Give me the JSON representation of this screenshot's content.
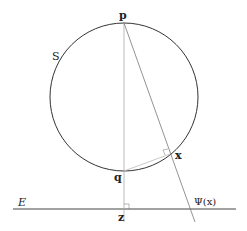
{
  "diagram": {
    "labels": {
      "p": "p",
      "q": "q",
      "x": "x",
      "z": "z",
      "sphere": "S",
      "plane": "E",
      "projection": "Ψ(x)"
    },
    "colors": {
      "stroke": "#333333",
      "thin": "#999999",
      "background": "#ffffff"
    },
    "geometry": {
      "circle": {
        "cx": 124,
        "cy": 97,
        "r": 74
      },
      "plane_y": 209,
      "plane_x": [
        13,
        236
      ],
      "p": [
        124,
        23
      ],
      "q": [
        124,
        171
      ],
      "x": [
        172,
        153
      ],
      "z": [
        124,
        209
      ],
      "projection_end": [
        195,
        220
      ]
    }
  }
}
